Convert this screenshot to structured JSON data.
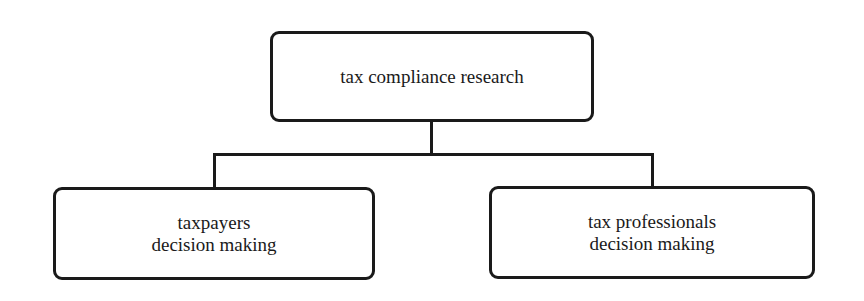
{
  "diagram": {
    "type": "tree",
    "root": {
      "label": "tax compliance research"
    },
    "children": [
      {
        "line1": "taxpayers",
        "line2": "decision making"
      },
      {
        "line1": "tax professionals",
        "line2": "decision making"
      }
    ],
    "colors": {
      "stroke": "#1a1a1a",
      "fill": "#ffffff",
      "text": "#1a1a1a"
    }
  }
}
